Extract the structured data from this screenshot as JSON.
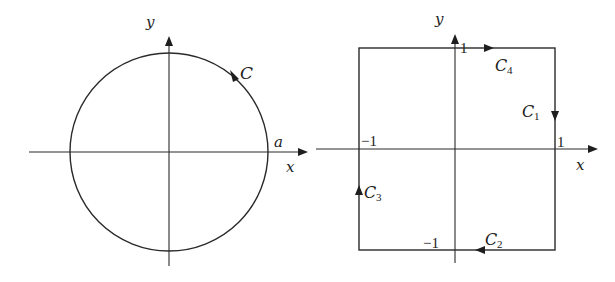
{
  "colors": {
    "background": "#ffffff",
    "stroke": "#2a2a2a",
    "text": "#222222"
  },
  "left_diagram": {
    "axis_x_label": "x",
    "axis_y_label": "y",
    "curve_label": "C",
    "radius_label": "a",
    "shape": "circle",
    "orientation": "counterclockwise"
  },
  "right_diagram": {
    "axis_x_label": "x",
    "axis_y_label": "y",
    "shape": "square",
    "tick_labels": {
      "x_pos": "1",
      "x_neg": "−1",
      "y_pos": "1",
      "y_neg": "−1"
    },
    "segments": [
      {
        "name": "C",
        "sub": "1",
        "side": "right",
        "direction": "down"
      },
      {
        "name": "C",
        "sub": "2",
        "side": "bottom",
        "direction": "left"
      },
      {
        "name": "C",
        "sub": "3",
        "side": "left",
        "direction": "up"
      },
      {
        "name": "C",
        "sub": "4",
        "side": "top",
        "direction": "right"
      }
    ],
    "orientation": "clockwise"
  }
}
